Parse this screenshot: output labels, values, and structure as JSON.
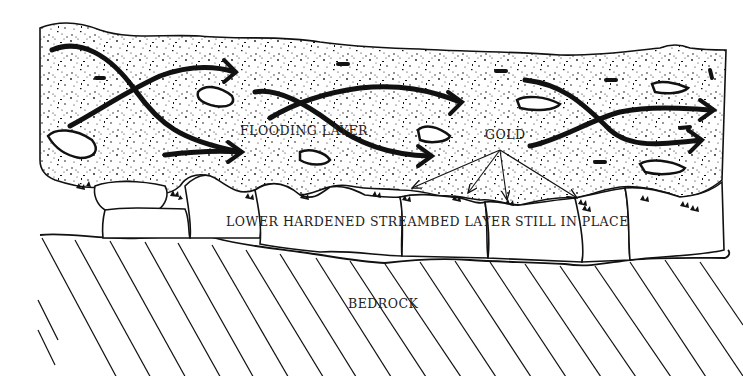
{
  "diagram": {
    "type": "geologic cross-section",
    "layers": [
      {
        "id": "flooding",
        "label": "FLOODING LAYER",
        "fill": "stippled gravel with flow arrows"
      },
      {
        "id": "hardened",
        "label": "LOWER HARDENED STREAMBED LAYER STILL IN PLACE",
        "fill": "boulders"
      },
      {
        "id": "bedrock",
        "label": "BEDROCK",
        "fill": "diagonal hatching"
      }
    ],
    "annotations": {
      "gold": "GOLD"
    }
  },
  "labels": {
    "flooding": "FLOODING LAYER",
    "gold": "GOLD",
    "hardened": "LOWER HARDENED STREAMBED LAYER STILL IN PLACE",
    "bedrock": "BEDROCK"
  },
  "colors": {
    "ink": "#111111",
    "paper": "#ffffff"
  }
}
